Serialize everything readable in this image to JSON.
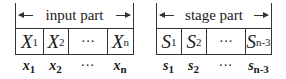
{
  "input_part": {
    "label": "input part",
    "cells": [
      {
        "base": "X",
        "sub": "1"
      },
      {
        "base": "X",
        "sub": "2"
      },
      {
        "base": "",
        "sub": "",
        "text": "···"
      },
      {
        "base": "X",
        "sub": "n"
      }
    ],
    "values": [
      {
        "base": "x",
        "sub": "1"
      },
      {
        "base": "x",
        "sub": "2"
      },
      {
        "base": "",
        "sub": "",
        "text": "···"
      },
      {
        "base": "x",
        "sub": "n"
      }
    ]
  },
  "stage_part": {
    "label": "stage part",
    "cells": [
      {
        "base": "S",
        "sub": "1"
      },
      {
        "base": "S",
        "sub": "2"
      },
      {
        "base": "",
        "sub": "",
        "text": "···"
      },
      {
        "base": "S",
        "sub": "n-3"
      }
    ],
    "values": [
      {
        "base": "s",
        "sub": "1"
      },
      {
        "base": "s",
        "sub": "2"
      },
      {
        "base": "",
        "sub": "",
        "text": "···"
      },
      {
        "base": "s",
        "sub": "n-3"
      }
    ]
  },
  "icons": [
    "arrow-left-icon",
    "arrow-right-icon"
  ]
}
